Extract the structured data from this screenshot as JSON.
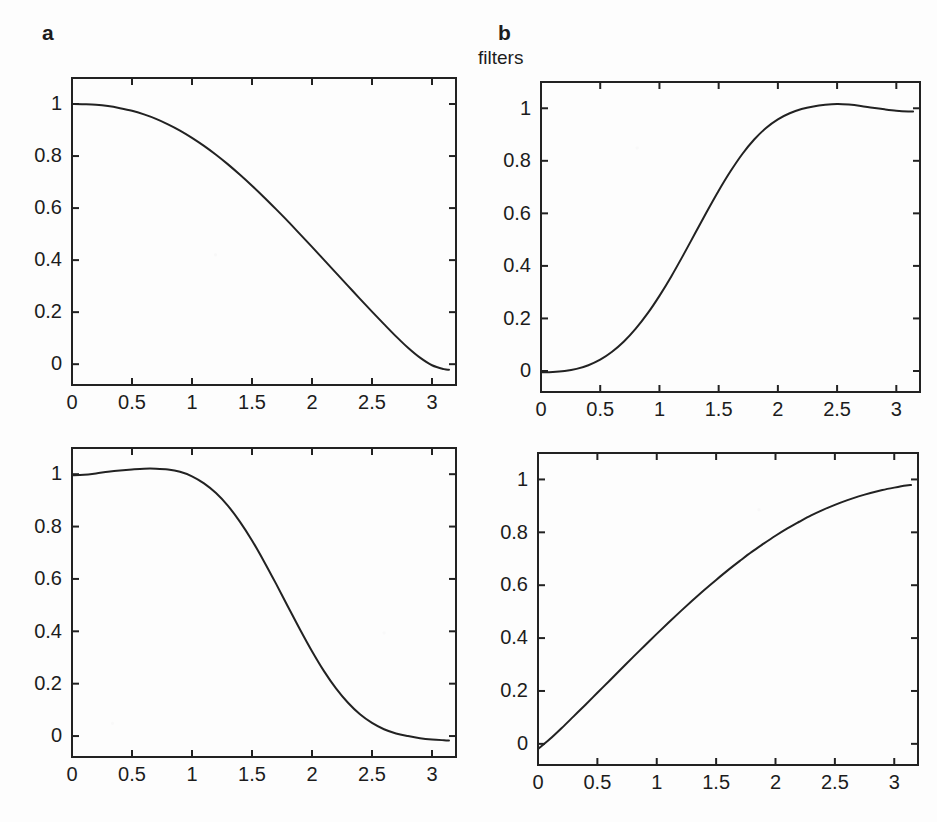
{
  "figure": {
    "title": "filters",
    "background_color": "#fdfdfd",
    "line_color": "#222222",
    "text_color": "#1c1c1c"
  },
  "labels": {
    "panel_a": "a",
    "panel_b": "b",
    "caption_b": "filters"
  },
  "chart_data": [
    {
      "id": "panel-a-top",
      "type": "line",
      "title": "a",
      "xlabel": "",
      "ylabel": "",
      "xlim": [
        0,
        3.2
      ],
      "ylim": [
        -0.08,
        1.1
      ],
      "grid": false,
      "legend": "none",
      "xticks": [
        0,
        0.5,
        1,
        1.5,
        2,
        2.5,
        3
      ],
      "xticklabels": [
        "0",
        "0.5",
        "1",
        "1.5",
        "2",
        "2.5",
        "3"
      ],
      "yticks": [
        0,
        0.2,
        0.4,
        0.6,
        0.8,
        1
      ],
      "yticklabels": [
        "0",
        "0.2",
        "0.4",
        "0.6",
        "0.8",
        "1"
      ],
      "x": [
        0,
        0.1,
        0.2,
        0.3,
        0.4,
        0.5,
        0.6,
        0.7,
        0.8,
        0.9,
        1.0,
        1.1,
        1.2,
        1.3,
        1.4,
        1.5,
        1.6,
        1.7,
        1.8,
        1.9,
        2.0,
        2.1,
        2.2,
        2.3,
        2.4,
        2.5,
        2.6,
        2.7,
        2.8,
        2.9,
        3.0,
        3.1,
        3.1416
      ],
      "y": [
        1.0,
        0.999,
        0.997,
        0.992,
        0.984,
        0.974,
        0.96,
        0.943,
        0.922,
        0.898,
        0.87,
        0.839,
        0.805,
        0.768,
        0.728,
        0.686,
        0.642,
        0.596,
        0.549,
        0.5,
        0.451,
        0.401,
        0.351,
        0.301,
        0.251,
        0.202,
        0.154,
        0.107,
        0.063,
        0.025,
        -0.004,
        -0.019,
        -0.021
      ]
    },
    {
      "id": "panel-b-top",
      "type": "line",
      "title": "b",
      "xlabel": "",
      "ylabel": "",
      "xlim": [
        0,
        3.2
      ],
      "ylim": [
        -0.08,
        1.1
      ],
      "grid": false,
      "legend": "none",
      "xticks": [
        0,
        0.5,
        1,
        1.5,
        2,
        2.5,
        3
      ],
      "xticklabels": [
        "0",
        "0.5",
        "1",
        "1.5",
        "2",
        "2.5",
        "3"
      ],
      "yticks": [
        0,
        0.2,
        0.4,
        0.6,
        0.8,
        1
      ],
      "yticklabels": [
        "0",
        "0.2",
        "0.4",
        "0.6",
        "0.8",
        "1"
      ],
      "x": [
        0,
        0.1,
        0.2,
        0.3,
        0.4,
        0.5,
        0.6,
        0.7,
        0.8,
        0.9,
        1.0,
        1.1,
        1.2,
        1.3,
        1.4,
        1.5,
        1.6,
        1.7,
        1.8,
        1.9,
        2.0,
        2.1,
        2.2,
        2.3,
        2.4,
        2.5,
        2.6,
        2.7,
        2.8,
        2.9,
        3.0,
        3.1,
        3.1416
      ],
      "y": [
        -0.005,
        -0.004,
        0.0,
        0.008,
        0.022,
        0.043,
        0.073,
        0.112,
        0.161,
        0.219,
        0.286,
        0.36,
        0.44,
        0.523,
        0.606,
        0.686,
        0.76,
        0.826,
        0.881,
        0.925,
        0.958,
        0.981,
        0.997,
        1.007,
        1.013,
        1.016,
        1.014,
        1.009,
        1.002,
        0.996,
        0.991,
        0.988,
        0.988
      ]
    },
    {
      "id": "panel-a-bottom",
      "type": "line",
      "title": "",
      "xlabel": "",
      "ylabel": "",
      "xlim": [
        0,
        3.2
      ],
      "ylim": [
        -0.08,
        1.1
      ],
      "grid": false,
      "legend": "none",
      "xticks": [
        0,
        0.5,
        1,
        1.5,
        2,
        2.5,
        3
      ],
      "xticklabels": [
        "0",
        "0.5",
        "1",
        "1.5",
        "2",
        "2.5",
        "3"
      ],
      "yticks": [
        0,
        0.2,
        0.4,
        0.6,
        0.8,
        1
      ],
      "yticklabels": [
        "0",
        "0.2",
        "0.4",
        "0.6",
        "0.8",
        "1"
      ],
      "x": [
        0,
        0.1,
        0.2,
        0.3,
        0.4,
        0.5,
        0.6,
        0.7,
        0.8,
        0.9,
        1.0,
        1.1,
        1.2,
        1.3,
        1.4,
        1.5,
        1.6,
        1.7,
        1.8,
        1.9,
        2.0,
        2.1,
        2.2,
        2.3,
        2.4,
        2.5,
        2.6,
        2.7,
        2.8,
        2.9,
        3.0,
        3.1,
        3.1416
      ],
      "y": [
        0.996,
        0.998,
        1.003,
        1.009,
        1.014,
        1.018,
        1.021,
        1.021,
        1.018,
        1.009,
        0.992,
        0.965,
        0.928,
        0.879,
        0.818,
        0.747,
        0.667,
        0.582,
        0.494,
        0.407,
        0.324,
        0.248,
        0.182,
        0.127,
        0.083,
        0.05,
        0.026,
        0.01,
        0.0,
        -0.008,
        -0.013,
        -0.016,
        -0.017
      ]
    },
    {
      "id": "panel-b-bottom",
      "type": "line",
      "title": "",
      "xlabel": "",
      "ylabel": "",
      "xlim": [
        0,
        3.2
      ],
      "ylim": [
        -0.08,
        1.1
      ],
      "grid": false,
      "legend": "none",
      "xticks": [
        0,
        0.5,
        1,
        1.5,
        2,
        2.5,
        3
      ],
      "xticklabels": [
        "0",
        "0.5",
        "1",
        "1.5",
        "2",
        "2.5",
        "3"
      ],
      "yticks": [
        0,
        0.2,
        0.4,
        0.6,
        0.8,
        1
      ],
      "yticklabels": [
        "0",
        "0.2",
        "0.4",
        "0.6",
        "0.8",
        "1"
      ],
      "x": [
        0,
        0.1,
        0.2,
        0.3,
        0.4,
        0.5,
        0.6,
        0.7,
        0.8,
        0.9,
        1.0,
        1.1,
        1.2,
        1.3,
        1.4,
        1.5,
        1.6,
        1.7,
        1.8,
        1.9,
        2.0,
        2.1,
        2.2,
        2.3,
        2.4,
        2.5,
        2.6,
        2.7,
        2.8,
        2.9,
        3.0,
        3.1,
        3.1416
      ],
      "y": [
        -0.02,
        0.018,
        0.06,
        0.104,
        0.148,
        0.193,
        0.238,
        0.283,
        0.328,
        0.372,
        0.416,
        0.459,
        0.501,
        0.542,
        0.582,
        0.62,
        0.657,
        0.692,
        0.726,
        0.757,
        0.787,
        0.815,
        0.84,
        0.864,
        0.885,
        0.904,
        0.921,
        0.936,
        0.949,
        0.96,
        0.969,
        0.977,
        0.979
      ]
    }
  ]
}
